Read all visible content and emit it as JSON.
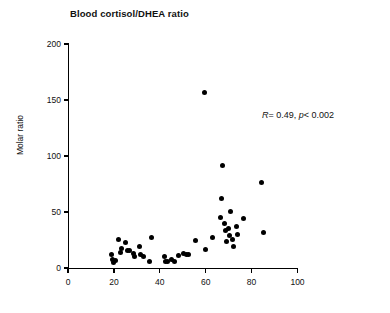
{
  "chart_data": {
    "type": "scatter",
    "title": "Blood cortisol/DHEA ratio",
    "xlabel": "",
    "ylabel": "Molar ratio",
    "xlim": [
      0,
      100
    ],
    "ylim": [
      0,
      200
    ],
    "xticks": [
      0,
      20,
      40,
      60,
      80,
      100
    ],
    "yticks": [
      0,
      50,
      100,
      150,
      200
    ],
    "xticklabels": [
      "0",
      "20",
      "40",
      "60",
      "80",
      "100"
    ],
    "yticklabels": [
      "0",
      "50",
      "100",
      "150",
      "200"
    ],
    "grid": false,
    "legend": null,
    "annotations": [
      {
        "name": "correlation-stats",
        "text": "R = 0.49, p < 0.002",
        "r_symbol": "R",
        "r_value": "= 0.49,",
        "p_symbol": "p",
        "p_value": "< 0.002"
      }
    ],
    "marker": {
      "shape": "circle",
      "color": "#000000",
      "size": 5
    },
    "points": [
      {
        "x": 19.0,
        "y": 12.5
      },
      {
        "x": 19.5,
        "y": 8.0
      },
      {
        "x": 20.0,
        "y": 4.5
      },
      {
        "x": 20.5,
        "y": 6.5
      },
      {
        "x": 22.0,
        "y": 25.5
      },
      {
        "x": 23.0,
        "y": 13.5
      },
      {
        "x": 23.5,
        "y": 17.0
      },
      {
        "x": 25.0,
        "y": 23.0
      },
      {
        "x": 26.0,
        "y": 16.0
      },
      {
        "x": 27.0,
        "y": 15.5
      },
      {
        "x": 28.5,
        "y": 13.0
      },
      {
        "x": 29.0,
        "y": 10.5
      },
      {
        "x": 31.0,
        "y": 19.5
      },
      {
        "x": 31.5,
        "y": 12.5
      },
      {
        "x": 33.0,
        "y": 10.0
      },
      {
        "x": 35.5,
        "y": 5.5
      },
      {
        "x": 36.5,
        "y": 27.0
      },
      {
        "x": 42.0,
        "y": 10.5
      },
      {
        "x": 42.5,
        "y": 6.0
      },
      {
        "x": 43.5,
        "y": 5.5
      },
      {
        "x": 45.0,
        "y": 7.5
      },
      {
        "x": 46.5,
        "y": 5.5
      },
      {
        "x": 48.0,
        "y": 11.5
      },
      {
        "x": 50.5,
        "y": 13.0
      },
      {
        "x": 51.5,
        "y": 12.5
      },
      {
        "x": 52.5,
        "y": 12.0
      },
      {
        "x": 55.5,
        "y": 25.0
      },
      {
        "x": 59.5,
        "y": 157.0
      },
      {
        "x": 60.0,
        "y": 16.5
      },
      {
        "x": 63.0,
        "y": 27.0
      },
      {
        "x": 66.5,
        "y": 45.5
      },
      {
        "x": 67.0,
        "y": 62.0
      },
      {
        "x": 67.5,
        "y": 91.5
      },
      {
        "x": 68.0,
        "y": 40.0
      },
      {
        "x": 68.5,
        "y": 33.5
      },
      {
        "x": 69.0,
        "y": 23.5
      },
      {
        "x": 70.0,
        "y": 35.0
      },
      {
        "x": 70.5,
        "y": 29.0
      },
      {
        "x": 71.0,
        "y": 50.5
      },
      {
        "x": 71.5,
        "y": 25.5
      },
      {
        "x": 72.0,
        "y": 19.0
      },
      {
        "x": 73.5,
        "y": 37.0
      },
      {
        "x": 74.0,
        "y": 29.5
      },
      {
        "x": 76.5,
        "y": 44.0
      },
      {
        "x": 84.5,
        "y": 76.0
      },
      {
        "x": 85.0,
        "y": 32.0
      }
    ]
  }
}
